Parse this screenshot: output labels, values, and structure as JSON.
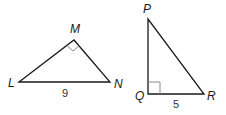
{
  "diagram": {
    "triangles": [
      {
        "name": "LMN",
        "vertices": [
          {
            "label": "L",
            "x": 19,
            "y": 82
          },
          {
            "label": "M",
            "x": 74,
            "y": 40
          },
          {
            "label": "N",
            "x": 110,
            "y": 82
          }
        ],
        "right_angle_at": "M",
        "side_labels": [
          {
            "side": "LN",
            "value": "9"
          }
        ]
      },
      {
        "name": "PQR",
        "vertices": [
          {
            "label": "P",
            "x": 148,
            "y": 19
          },
          {
            "label": "Q",
            "x": 148,
            "y": 94
          },
          {
            "label": "R",
            "x": 204,
            "y": 94
          }
        ],
        "right_angle_at": "Q",
        "side_labels": [
          {
            "side": "QR",
            "value": "5"
          }
        ]
      }
    ],
    "colors": {
      "edge": "#1a1a1a",
      "right_angle_marker": "#8a8a8a"
    }
  }
}
